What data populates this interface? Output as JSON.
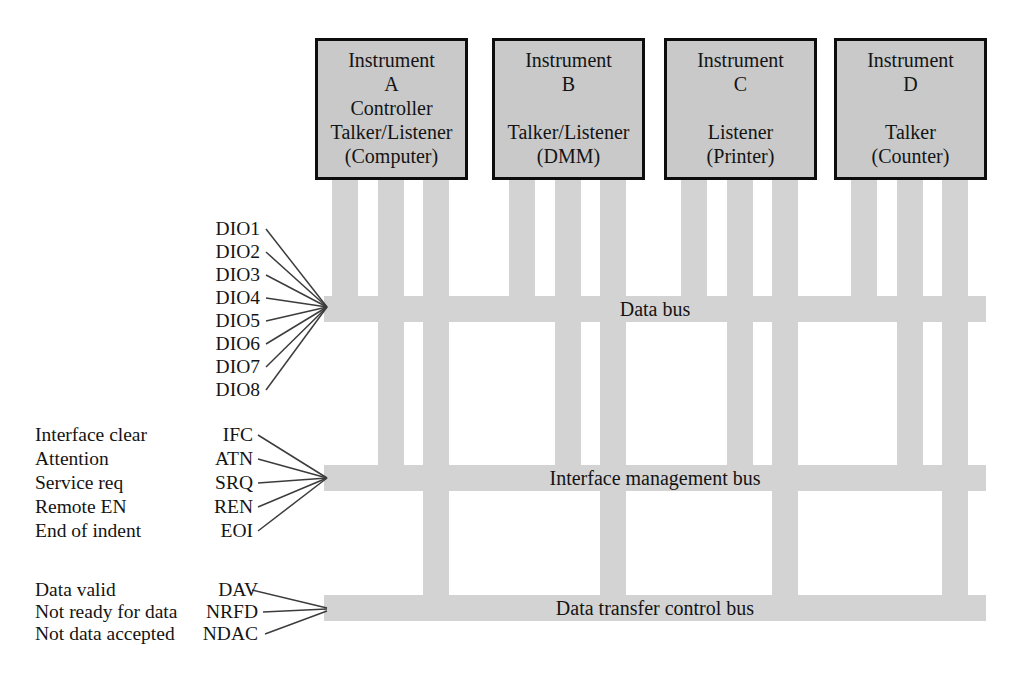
{
  "diagram": {
    "instruments": [
      {
        "id": "A",
        "lines": [
          "Instrument",
          "A",
          "Controller",
          "Talker/Listener",
          "(Computer)"
        ]
      },
      {
        "id": "B",
        "lines": [
          "Instrument",
          "B",
          "",
          "Talker/Listener",
          "(DMM)"
        ]
      },
      {
        "id": "C",
        "lines": [
          "Instrument",
          "C",
          "",
          "Listener",
          "(Printer)"
        ]
      },
      {
        "id": "D",
        "lines": [
          "Instrument",
          "D",
          "",
          "Talker",
          "(Counter)"
        ]
      }
    ],
    "buses": [
      {
        "label": "Data bus"
      },
      {
        "label": "Interface management bus"
      },
      {
        "label": "Data transfer control bus"
      }
    ],
    "data_bus_signals": [
      "DIO1",
      "DIO2",
      "DIO3",
      "DIO4",
      "DIO5",
      "DIO6",
      "DIO7",
      "DIO8"
    ],
    "management_signals": [
      {
        "description": "Interface clear",
        "acronym": "IFC"
      },
      {
        "description": "Attention",
        "acronym": "ATN"
      },
      {
        "description": "Service req",
        "acronym": "SRQ"
      },
      {
        "description": "Remote EN",
        "acronym": "REN"
      },
      {
        "description": "End of indent",
        "acronym": "EOI"
      }
    ],
    "transfer_signals": [
      {
        "description": "Data valid",
        "acronym": "DAV"
      },
      {
        "description": "Not ready for data",
        "acronym": "NRFD"
      },
      {
        "description": "Not data accepted",
        "acronym": "NDAC"
      }
    ],
    "colors": {
      "box_fill": "#c9c9c9",
      "box_border": "#0d0d0d",
      "bus_fill": "#d3d3d3",
      "connector_line": "#3c3c3c",
      "text": "#141414",
      "background": "#ffffff"
    }
  }
}
